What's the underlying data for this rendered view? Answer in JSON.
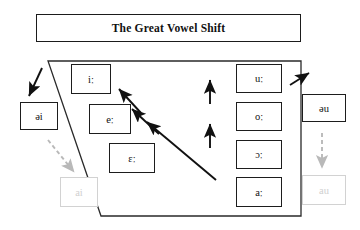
{
  "title": {
    "text": "The Great Vowel Shift"
  },
  "diagram": {
    "type": "vowel-shift-diagram",
    "shape": "trapezoid-vowel-space",
    "colors": {
      "stroke": "#1d1d1d",
      "faded_stroke": "#d2d2d2",
      "faded_text": "#cfcfcf",
      "arrow_solid": "#111111",
      "arrow_dashed": "#b9b9b9",
      "background": "#ffffff"
    },
    "front_vowels": [
      {
        "symbol": "iː",
        "name": "close-front-long"
      },
      {
        "symbol": "eː",
        "name": "close-mid-front-long"
      },
      {
        "symbol": "ɛː",
        "name": "open-mid-front-long"
      }
    ],
    "back_vowels": [
      {
        "symbol": "uː",
        "name": "close-back-long"
      },
      {
        "symbol": "oː",
        "name": "close-mid-back-long"
      },
      {
        "symbol": "ɔː",
        "name": "open-mid-back-long"
      },
      {
        "symbol": "aː",
        "name": "open-back-long"
      }
    ],
    "diphthongs": [
      {
        "symbol": "əi",
        "name": "front-diphthong-output",
        "faded": false
      },
      {
        "symbol": "ai",
        "name": "front-diphthong-modern",
        "faded": true
      },
      {
        "symbol": "əu",
        "name": "back-diphthong-output",
        "faded": false
      },
      {
        "symbol": "au",
        "name": "back-diphthong-modern",
        "faded": true
      }
    ],
    "arrows": {
      "raising_diagonal_count": 3,
      "raising_vertical_count": 2,
      "diphthong_solid_count": 2,
      "diphthong_dashed_count": 2
    }
  }
}
